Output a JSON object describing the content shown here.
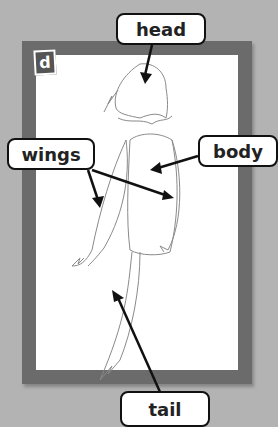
{
  "badge": {
    "letter": "d"
  },
  "labels": {
    "head": "head",
    "wings": "wings",
    "body": "body",
    "tail": "tail"
  },
  "colors": {
    "background": "#b3b3b3",
    "frame": "#6b6b6b",
    "paper": "#ffffff",
    "badge": "#555555",
    "outline": "#888888",
    "arrow": "#111111"
  }
}
